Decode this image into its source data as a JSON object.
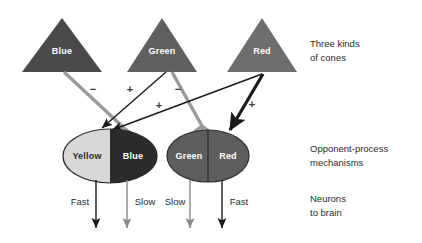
{
  "figure": {
    "title_visible": false,
    "background": "#ffffff"
  },
  "colors": {
    "cone_blue": "#4a4a4a",
    "cone_green": "#606060",
    "cone_red": "#6e6e6e",
    "opp_yellow": "#d8d8d8",
    "opp_blue": "#2b2b2b",
    "opp_green": "#5e5e5e",
    "opp_red": "#5e5e5e",
    "excitatory_line": "#1a1a1a",
    "inhibitory_line": "#9a9a9a",
    "fast_arrow": "#1a1a1a",
    "slow_arrow": "#8a8a8a",
    "text": "#2b2b2b"
  },
  "cones": {
    "row_note_line1": "Three kinds",
    "row_note_line2": "of cones",
    "items": [
      {
        "label": "Blue",
        "fill_key": "cone_blue",
        "cx": 62,
        "apex_y": 18,
        "base_y": 72,
        "half_width": 40
      },
      {
        "label": "Green",
        "fill_key": "cone_green",
        "cx": 162,
        "apex_y": 18,
        "base_y": 72,
        "half_width": 35
      },
      {
        "label": "Red",
        "fill_key": "cone_red",
        "cx": 262,
        "apex_y": 18,
        "base_y": 72,
        "half_width": 35
      }
    ]
  },
  "opponent_mechanisms": {
    "row_note_line1": "Opponent-process",
    "row_note_line2": "mechanisms",
    "items": [
      {
        "id": "yellow-blue",
        "cx": 110,
        "cy": 156,
        "rx": 47,
        "ry": 27,
        "left": {
          "label": "Yellow",
          "fill_key": "opp_yellow",
          "text_tone": "on-light"
        },
        "right": {
          "label": "Blue",
          "fill_key": "opp_blue",
          "text_tone": "on-dark"
        }
      },
      {
        "id": "green-red",
        "cx": 208,
        "cy": 156,
        "rx": 41,
        "ry": 26,
        "left": {
          "label": "Green",
          "fill_key": "opp_green",
          "text_tone": "on-dark"
        },
        "right": {
          "label": "Red",
          "fill_key": "opp_red",
          "text_tone": "on-dark"
        }
      }
    ]
  },
  "connections": {
    "signs": [
      {
        "symbol": "−",
        "x": 93,
        "y": 90,
        "from": "Blue",
        "to": "Yellow-Blue",
        "type": "inhibitory"
      },
      {
        "symbol": "+",
        "x": 130,
        "y": 90,
        "from": "Green",
        "to": "Yellow-Blue",
        "type": "excitatory"
      },
      {
        "symbol": "−",
        "x": 178,
        "y": 90,
        "from": "Green",
        "to": "Green-Red",
        "type": "inhibitory"
      },
      {
        "symbol": "+",
        "x": 159,
        "y": 106,
        "from": "Red",
        "to": "Yellow-Blue",
        "type": "excitatory"
      },
      {
        "symbol": "+",
        "x": 252,
        "y": 105,
        "from": "Red",
        "to": "Green-Red",
        "type": "excitatory"
      }
    ]
  },
  "neurons": {
    "row_note_line1": "Neurons",
    "row_note_line2": "to brain",
    "outputs": [
      {
        "label": "Fast",
        "x": 96,
        "label_x": 80,
        "label_y": 202,
        "top_y": 180,
        "bottom_y": 232,
        "speed": "fast"
      },
      {
        "label": "Slow",
        "x": 127,
        "label_x": 144,
        "label_y": 202,
        "top_y": 180,
        "bottom_y": 232,
        "speed": "slow"
      },
      {
        "label": "Slow",
        "x": 190,
        "label_x": 176,
        "label_y": 202,
        "top_y": 180,
        "bottom_y": 232,
        "speed": "slow"
      },
      {
        "label": "Fast",
        "x": 222,
        "label_x": 238,
        "label_y": 202,
        "top_y": 180,
        "bottom_y": 232,
        "speed": "fast"
      }
    ]
  },
  "side_notes": [
    {
      "line1": "Three kinds",
      "line2": "of cones",
      "x": 310,
      "y1": 44,
      "y2": 58
    },
    {
      "line1": "Opponent-process",
      "line2": "mechanisms",
      "x": 310,
      "y1": 149,
      "y2": 163
    },
    {
      "line1": "Neurons",
      "line2": "to brain",
      "x": 310,
      "y1": 199,
      "y2": 213
    }
  ]
}
